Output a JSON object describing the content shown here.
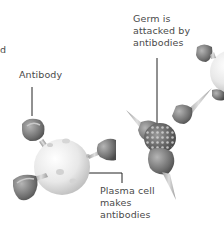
{
  "diagram": {
    "labels": {
      "partial_left": "d",
      "antibody": "Antibody",
      "germ": [
        "Germ is",
        "attacked by",
        "antibodies"
      ],
      "plasma_cell": [
        "Plasma cell",
        "makes",
        "antibodies"
      ]
    },
    "elements": [
      {
        "name": "plasma-cell",
        "description": "Pale spherical cell with dimples, antibodies attached"
      },
      {
        "name": "antibody",
        "description": "Grey cup-shaped antibody with stalk"
      },
      {
        "name": "germ",
        "description": "Textured germ body surrounded by antibodies"
      },
      {
        "name": "plasma-cell-partial-right",
        "description": "Second plasma cell partially visible at right edge"
      }
    ],
    "colors": {
      "background": "#ffffff",
      "text": "#4a4a4a",
      "leader_line": "#222222",
      "antibody": "#7a7a7a",
      "cell": "#e6e6e6"
    }
  }
}
